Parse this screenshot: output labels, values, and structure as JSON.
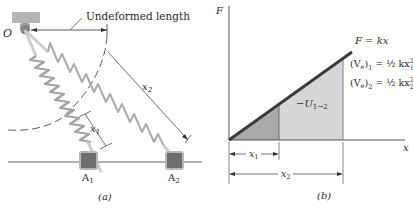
{
  "panel_a": {
    "caption": "(a)",
    "pivot_label": "O",
    "undeformed_label": "Undeformed length",
    "x1_label": "x",
    "x1_sub": "1",
    "x2_label": "x",
    "x2_sub": "2",
    "block1_label": "A",
    "block1_sub": "1",
    "block2_label": "A",
    "block2_sub": "2"
  },
  "panel_b": {
    "caption": "(b)",
    "y_axis_label": "F",
    "x_axis_label": "x",
    "line_label": "F = kx",
    "ve1_lhs": "(V",
    "ve1_sub_e": "e",
    "ve1_sub": "1",
    "ve1_rhs": " = ½ kx",
    "ve1_x_sub": "1",
    "ve1_sup": "2",
    "ve2_lhs": "(V",
    "ve2_sub_e": "e",
    "ve2_sub": "2",
    "ve2_rhs": " = ½ kx",
    "ve2_x_sub": "2",
    "ve2_sup": "2",
    "work_label": "−U",
    "work_sub": "1→2",
    "x1_dim": "x",
    "x1_dim_sub": "1",
    "x2_dim": "x",
    "x2_dim_sub": "2"
  },
  "colors": {
    "line": "#3a3a3a",
    "area_x1": "#a9a9a9",
    "area_x2": "#d6d6d6",
    "spring": "#c9cfc9",
    "spring_dark": "#8f968f",
    "block": "#6e6e6e",
    "block_border": "#b8b8b8",
    "support": "#b5b5b5"
  }
}
